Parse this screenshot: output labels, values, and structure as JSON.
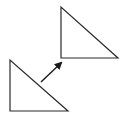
{
  "diagram": {
    "type": "geometric-translation",
    "stroke_color": "#2a2a2a",
    "background": "#ffffff",
    "shapes": [
      {
        "name": "original-triangle",
        "points": [
          [
            10,
            60
          ],
          [
            10,
            111
          ],
          [
            68,
            111
          ]
        ]
      },
      {
        "name": "translated-triangle",
        "points": [
          [
            61,
            7
          ],
          [
            61,
            58
          ],
          [
            118,
            58
          ]
        ]
      }
    ],
    "arrow": {
      "name": "translation-arrow",
      "from": [
        41,
        82
      ],
      "to": [
        61,
        63
      ]
    }
  }
}
